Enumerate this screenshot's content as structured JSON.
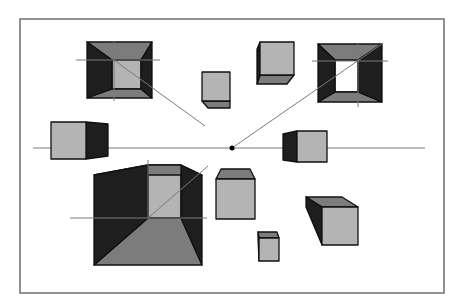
{
  "diagram": {
    "frame": {
      "x": 20,
      "y": 19,
      "w": 424,
      "h": 274,
      "stroke": "#6e6e6e"
    },
    "horizon": {
      "x1": 33,
      "x2": 425,
      "y": 148,
      "stroke": "#7a7a7a"
    },
    "vanishing_point": {
      "x": 232,
      "y": 148,
      "r": 2.5,
      "fill": "#000000"
    },
    "colors": {
      "front": "#b4b4b4",
      "top": "#7c7c7c",
      "side_dark": "#1e1e1e",
      "bottom": "#7c7c7c",
      "edge": "#101010",
      "guide": "#7a7a7a"
    },
    "cubes": [
      {
        "name": "cube-top-left-hollow",
        "front": [
          87,
          42,
          152,
          98
        ],
        "back": [
          112,
          60,
          141,
          89
        ],
        "hollow": true
      },
      {
        "name": "cube-top-mid-small",
        "front": [
          202,
          72,
          230,
          101
        ],
        "back": [
          208,
          72,
          230,
          108
        ],
        "hollow": false
      },
      {
        "name": "cube-top-center",
        "front": [
          260,
          42,
          294,
          75
        ],
        "back": [
          257,
          49,
          287,
          84
        ],
        "hollow": false
      },
      {
        "name": "cube-top-right-hollow",
        "front": [
          318,
          44,
          382,
          102
        ],
        "back": [
          335,
          60,
          358,
          92
        ],
        "hollow": true
      },
      {
        "name": "cube-left-mid",
        "front": [
          51,
          122,
          86,
          159
        ],
        "back": [
          86,
          124,
          108,
          156
        ],
        "hollow": false
      },
      {
        "name": "cube-right-mid",
        "front": [
          297,
          131,
          327,
          162
        ],
        "back": [
          283,
          134,
          297,
          160
        ],
        "hollow": false
      },
      {
        "name": "cube-bottom-left-large",
        "front": [
          94,
          175,
          202,
          265
        ],
        "back": [
          148,
          165,
          181,
          218
        ],
        "hollow": true
      },
      {
        "name": "cube-bottom-mid",
        "front": [
          216,
          179,
          255,
          219
        ],
        "back": [
          221,
          169,
          250,
          179
        ],
        "hollow": false
      },
      {
        "name": "cube-bottom-small",
        "front": [
          259,
          238,
          279,
          261
        ],
        "back": [
          258,
          232,
          277,
          238
        ],
        "hollow": false
      },
      {
        "name": "cube-bottom-right",
        "front": [
          322,
          207,
          358,
          245
        ],
        "back": [
          306,
          197,
          342,
          207
        ],
        "hollow": false
      }
    ],
    "guide_lines": [
      {
        "name": "guide-tl-horizontal",
        "x1": 76,
        "y1": 60,
        "x2": 160,
        "y2": 60
      },
      {
        "name": "guide-tl-vertical",
        "x1": 114,
        "y1": 42,
        "x2": 114,
        "y2": 101
      },
      {
        "name": "guide-tl-diagonal",
        "x1": 114,
        "y1": 60,
        "x2": 205,
        "y2": 126
      },
      {
        "name": "guide-tr-horizontal",
        "x1": 312,
        "y1": 61,
        "x2": 388,
        "y2": 61
      },
      {
        "name": "guide-tr-vertical",
        "x1": 358,
        "y1": 44,
        "x2": 358,
        "y2": 107
      },
      {
        "name": "guide-tr-diagonal",
        "x1": 232,
        "y1": 148,
        "x2": 382,
        "y2": 44
      },
      {
        "name": "guide-bl-horizontal",
        "x1": 70,
        "y1": 218,
        "x2": 207,
        "y2": 218
      },
      {
        "name": "guide-bl-vertical",
        "x1": 148,
        "y1": 160,
        "x2": 148,
        "y2": 218
      },
      {
        "name": "guide-bl-diagonal",
        "x1": 148,
        "y1": 218,
        "x2": 208,
        "y2": 166
      }
    ]
  }
}
